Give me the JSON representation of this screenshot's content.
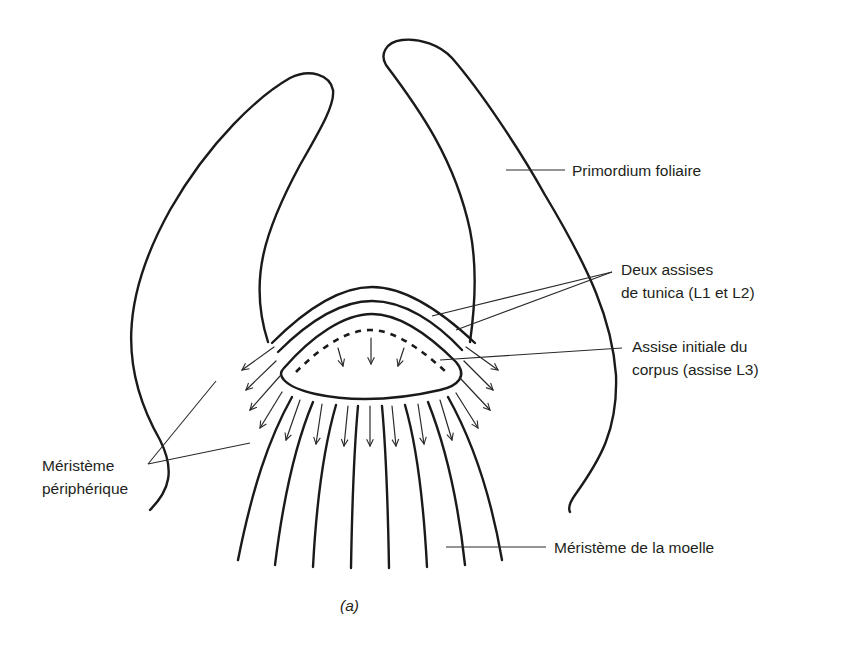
{
  "figure": {
    "caption": "(a)"
  },
  "labels": {
    "primordium": "Primordium foliaire",
    "tunica_line1": "Deux assises",
    "tunica_line2": "de tunica (L1 et L2)",
    "corpus_line1": "Assise initiale du",
    "corpus_line2": "corpus (assise L3)",
    "peripheral_line1": "Méristème",
    "peripheral_line2": "périphérique",
    "pith": "Méristème de la moelle"
  },
  "colors": {
    "stroke": "#1a1a1a",
    "text": "#231f20",
    "background": "#ffffff"
  }
}
